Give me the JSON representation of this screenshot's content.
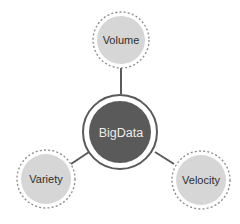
{
  "diagram": {
    "type": "hub-and-spoke",
    "center": {
      "label": "BigData",
      "fill": "#5a5a5a",
      "ring_color": "#5a5a5a"
    },
    "nodes": [
      {
        "label": "Volume",
        "position": "top"
      },
      {
        "label": "Variety",
        "position": "bottom-left"
      },
      {
        "label": "Velocity",
        "position": "bottom-right"
      }
    ],
    "colors": {
      "node_fill": "#d6d6d6",
      "node_dash": "#8a8a8a",
      "connector": "#5a5a5a",
      "text_dark": "#2e2e2e",
      "text_light": "#ececec",
      "background": "#ffffff"
    }
  }
}
